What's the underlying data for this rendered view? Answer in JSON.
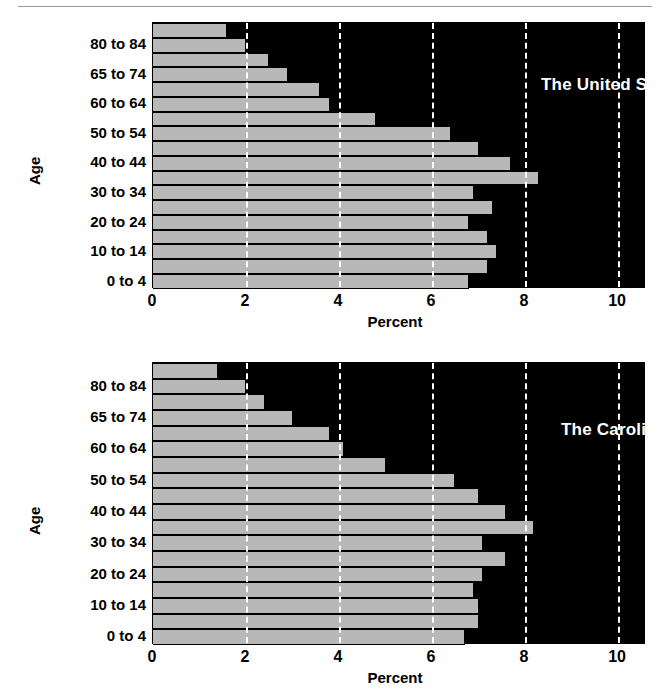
{
  "figure": {
    "background_color": "#ffffff",
    "plot_background_color": "#000000",
    "bar_color": "#b8b8b8",
    "gridline_color": "#ffffff",
    "text_color": "#000000"
  },
  "charts": [
    {
      "id": "chart-us",
      "title": "The United States",
      "xlabel": "Percent",
      "ylabel": "Age",
      "xticks": [
        "0",
        "2",
        "4",
        "6",
        "8",
        "10"
      ]
    },
    {
      "id": "chart-car",
      "title": "The Carolinas",
      "xlabel": "Percent",
      "ylabel": "Age",
      "xticks": [
        "0",
        "2",
        "4",
        "6",
        "8",
        "10"
      ]
    }
  ],
  "yticks_labels": [
    "80 to 84",
    "65 to 74",
    "60 to 64",
    "50 to 54",
    "40 to 44",
    "30 to 34",
    "20 to 24",
    "10 to 14",
    "0 to 4"
  ],
  "chart_data": [
    {
      "type": "bar",
      "orientation": "horizontal",
      "title": "The United States",
      "xlabel": "Percent",
      "ylabel": "Age",
      "xlim": [
        0,
        10.6
      ],
      "xticks": [
        0,
        2,
        4,
        6,
        8,
        10
      ],
      "grid": "vertical-dashed-white",
      "legend": "none",
      "categories": [
        "85 and over",
        "80 to 84",
        "75 to 79",
        "70 to 74",
        "65 to 69",
        "60 to 64",
        "55 to 59",
        "50 to 54",
        "45 to 49",
        "40 to 44",
        "35 to 39",
        "30 to 34",
        "25 to 29",
        "20 to 24",
        "15 to 19",
        "10 to 14",
        "5 to 9",
        "0 to 4"
      ],
      "values": [
        1.6,
        2.0,
        2.5,
        2.9,
        3.6,
        3.8,
        4.8,
        6.4,
        7.0,
        7.7,
        8.3,
        6.9,
        7.3,
        6.8,
        7.2,
        7.4,
        7.2,
        6.8
      ]
    },
    {
      "type": "bar",
      "orientation": "horizontal",
      "title": "The Carolinas",
      "xlabel": "Percent",
      "ylabel": "Age",
      "xlim": [
        0,
        10.6
      ],
      "xticks": [
        0,
        2,
        4,
        6,
        8,
        10
      ],
      "grid": "vertical-dashed-white",
      "legend": "none",
      "categories": [
        "85 and over",
        "80 to 84",
        "75 to 79",
        "70 to 74",
        "65 to 69",
        "60 to 64",
        "55 to 59",
        "50 to 54",
        "45 to 49",
        "40 to 44",
        "35 to 39",
        "30 to 34",
        "25 to 29",
        "20 to 24",
        "15 to 19",
        "10 to 14",
        "5 to 9",
        "0 to 4"
      ],
      "values": [
        1.4,
        2.0,
        2.4,
        3.0,
        3.8,
        4.1,
        5.0,
        6.5,
        7.0,
        7.6,
        8.2,
        7.1,
        7.6,
        7.1,
        6.9,
        7.0,
        7.0,
        6.7
      ]
    }
  ]
}
